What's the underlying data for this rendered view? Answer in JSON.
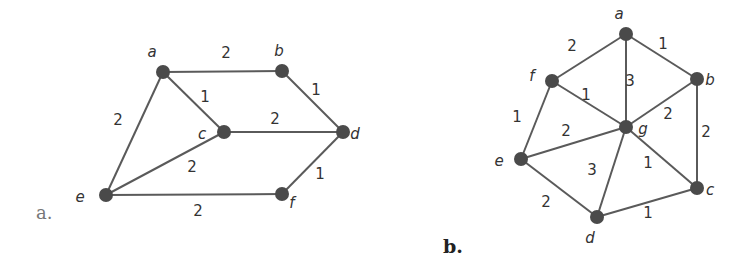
{
  "figures": [
    {
      "caption": "a.",
      "nodes": [
        {
          "id": "a",
          "x": 163,
          "y": 72,
          "lx": 152,
          "ly": 57
        },
        {
          "id": "b",
          "x": 282,
          "y": 71,
          "lx": 279,
          "ly": 56
        },
        {
          "id": "c",
          "x": 224,
          "y": 132,
          "lx": 202,
          "ly": 139
        },
        {
          "id": "d",
          "x": 343,
          "y": 132,
          "lx": 355,
          "ly": 139
        },
        {
          "id": "e",
          "x": 106,
          "y": 195,
          "lx": 80,
          "ly": 202
        },
        {
          "id": "f",
          "x": 282,
          "y": 194,
          "lx": 292,
          "ly": 208
        }
      ],
      "edges": [
        {
          "from": "a",
          "to": "b",
          "w": "2",
          "wx": 226,
          "wy": 58
        },
        {
          "from": "a",
          "to": "c",
          "w": "1",
          "wx": 205,
          "wy": 102
        },
        {
          "from": "a",
          "to": "e",
          "w": "2",
          "wx": 118,
          "wy": 125
        },
        {
          "from": "b",
          "to": "d",
          "w": "1",
          "wx": 316,
          "wy": 95
        },
        {
          "from": "c",
          "to": "d",
          "w": "2",
          "wx": 275,
          "wy": 124
        },
        {
          "from": "c",
          "to": "e",
          "w": "2",
          "wx": 192,
          "wy": 172
        },
        {
          "from": "d",
          "to": "f",
          "w": "1",
          "wx": 320,
          "wy": 179
        },
        {
          "from": "e",
          "to": "f",
          "w": "2",
          "wx": 198,
          "wy": 216
        }
      ]
    },
    {
      "caption": "b.",
      "nodes": [
        {
          "id": "a",
          "x": 626,
          "y": 34,
          "lx": 619,
          "ly": 19
        },
        {
          "id": "b",
          "x": 697,
          "y": 79,
          "lx": 710,
          "ly": 85
        },
        {
          "id": "c",
          "x": 697,
          "y": 188,
          "lx": 710,
          "ly": 195
        },
        {
          "id": "d",
          "x": 597,
          "y": 217,
          "lx": 590,
          "ly": 243
        },
        {
          "id": "e",
          "x": 521,
          "y": 159,
          "lx": 499,
          "ly": 166
        },
        {
          "id": "f",
          "x": 552,
          "y": 81,
          "lx": 532,
          "ly": 81
        },
        {
          "id": "g",
          "x": 626,
          "y": 127,
          "lx": 643,
          "ly": 134
        }
      ],
      "edges": [
        {
          "from": "a",
          "to": "f",
          "w": "2",
          "wx": 572,
          "wy": 51
        },
        {
          "from": "a",
          "to": "b",
          "w": "1",
          "wx": 663,
          "wy": 49
        },
        {
          "from": "a",
          "to": "g",
          "w": "3",
          "wx": 630,
          "wy": 86
        },
        {
          "from": "f",
          "to": "g",
          "w": "1",
          "wx": 586,
          "wy": 100
        },
        {
          "from": "b",
          "to": "g",
          "w": "2",
          "wx": 668,
          "wy": 119
        },
        {
          "from": "b",
          "to": "c",
          "w": "2",
          "wx": 706,
          "wy": 137
        },
        {
          "from": "f",
          "to": "e",
          "w": "1",
          "wx": 517,
          "wy": 122
        },
        {
          "from": "e",
          "to": "g",
          "w": "2",
          "wx": 566,
          "wy": 136
        },
        {
          "from": "g",
          "to": "d",
          "w": "3",
          "wx": 592,
          "wy": 175
        },
        {
          "from": "g",
          "to": "c",
          "w": "1",
          "wx": 648,
          "wy": 168
        },
        {
          "from": "e",
          "to": "d",
          "w": "2",
          "wx": 546,
          "wy": 207
        },
        {
          "from": "d",
          "to": "c",
          "w": "1",
          "wx": 648,
          "wy": 218
        }
      ]
    }
  ],
  "captions": {
    "a": "a.",
    "b": "b."
  }
}
